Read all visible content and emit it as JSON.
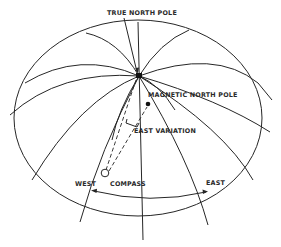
{
  "diagram": {
    "type": "magnetic-variation-globe",
    "labels": {
      "true_north_pole": "TRUE NORTH POLE",
      "magnetic_north_pole": "MAGNETIC NORTH POLE",
      "east_variation": "EAST VARIATION",
      "west": "WEST",
      "compass": "COMPASS",
      "east": "EAST"
    },
    "colors": {
      "line": "#262626",
      "background": "#ffffff"
    }
  }
}
